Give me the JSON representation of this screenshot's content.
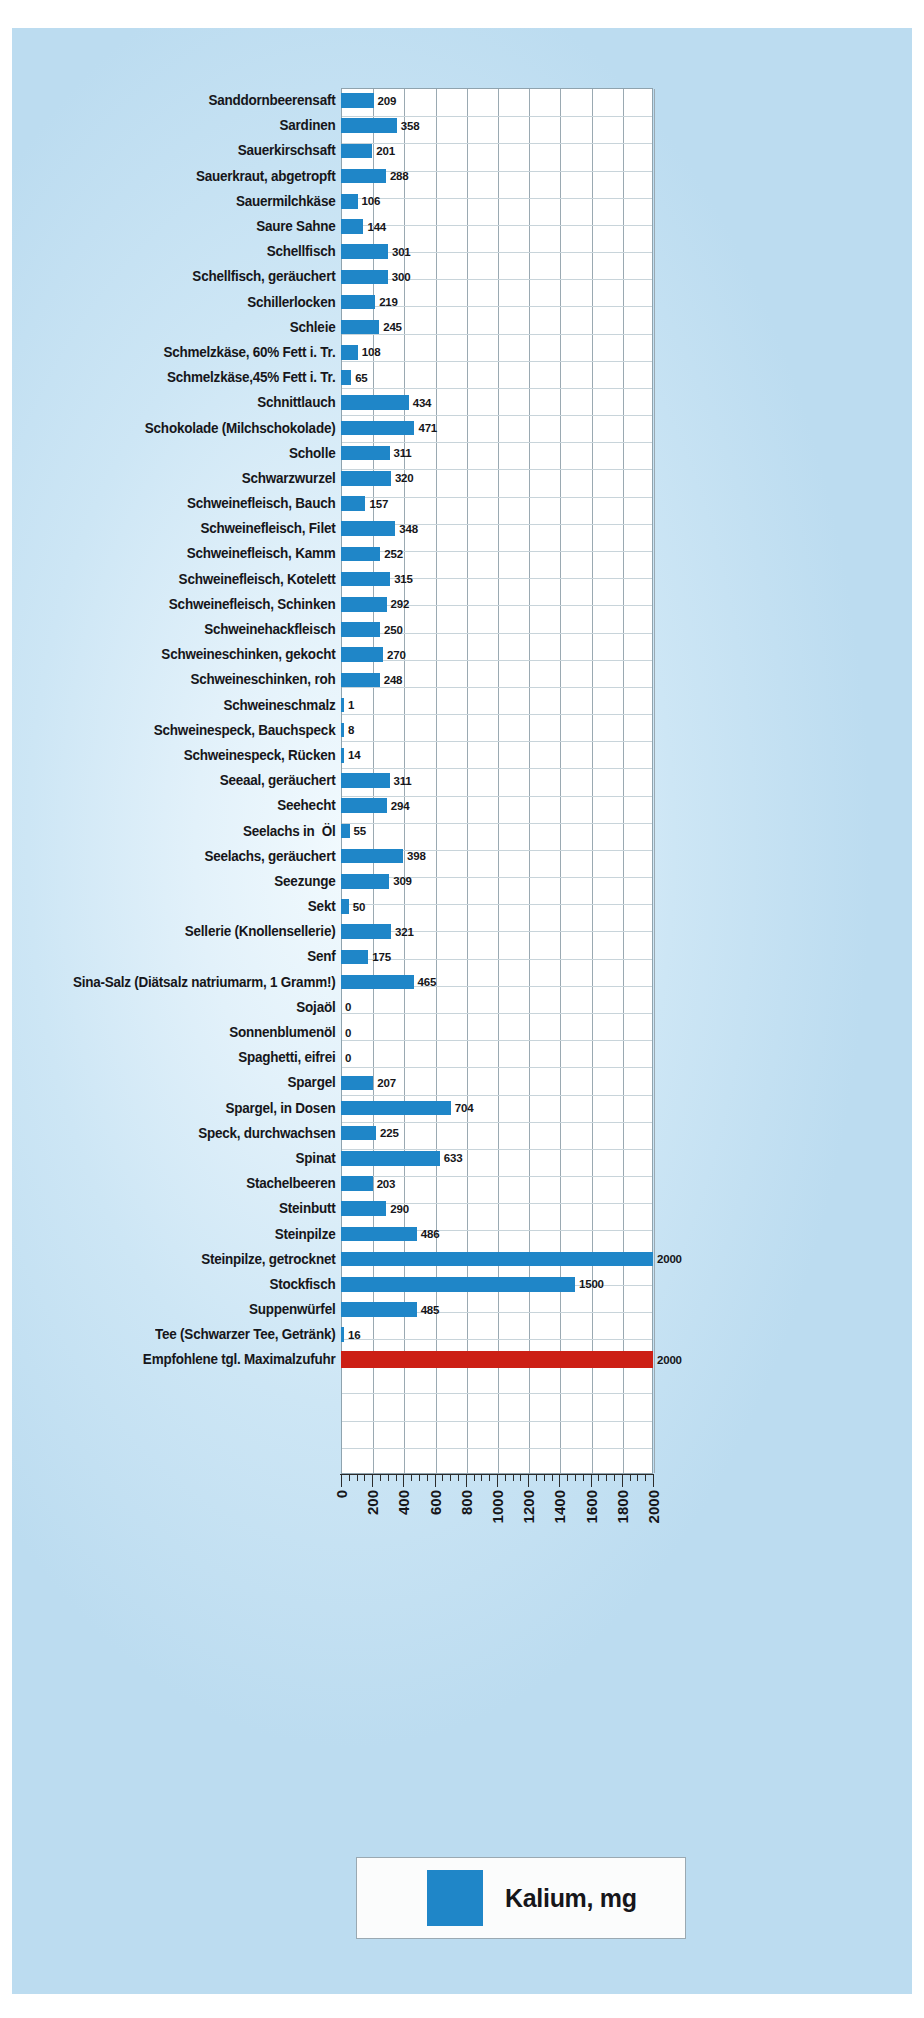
{
  "legend": {
    "series_label": "Kalium, mg",
    "swatch_color": "#1f86c8"
  },
  "axis": {
    "tick_labels": [
      "0",
      "200",
      "400",
      "600",
      "800",
      "1000",
      "1200",
      "1400",
      "1600",
      "1800",
      "2000"
    ]
  },
  "colors": {
    "bar": "#1f86c8",
    "limit_bar": "#cc1f15",
    "background": "#cde6f5",
    "plot_background": "#ffffff"
  },
  "chart_data": {
    "type": "bar",
    "orientation": "horizontal",
    "title": "",
    "xlabel": "",
    "ylabel": "",
    "xlim": [
      0,
      2000
    ],
    "grid": true,
    "legend_position": "bottom",
    "series": [
      {
        "name": "Kalium, mg",
        "color": "#1f86c8"
      }
    ],
    "categories": [
      "Sanddornbeerensaft",
      "Sardinen",
      "Sauerkirschsaft",
      "Sauerkraut, abgetropft",
      "Sauermilchkäse",
      "Saure Sahne",
      "Schellfisch",
      "Schellfisch, geräuchert",
      "Schillerlocken",
      "Schleie",
      "Schmelzkäse, 60% Fett i. Tr.",
      "Schmelzkäse,45% Fett i. Tr.",
      "Schnittlauch",
      "Schokolade (Milchschokolade)",
      "Scholle",
      "Schwarzwurzel",
      "Schweinefleisch, Bauch",
      "Schweinefleisch, Filet",
      "Schweinefleisch, Kamm",
      "Schweinefleisch, Kotelett",
      "Schweinefleisch, Schinken",
      "Schweinehackfleisch",
      "Schweineschinken, gekocht",
      "Schweineschinken, roh",
      "Schweineschmalz",
      "Schweinespeck, Bauchspeck",
      "Schweinespeck, Rücken",
      "Seeaal, geräuchert",
      "Seehecht",
      "Seelachs in  Öl",
      "Seelachs, geräuchert",
      "Seezunge",
      "Sekt",
      "Sellerie (Knollensellerie)",
      "Senf",
      "Sina-Salz (Diätsalz natriumarm, 1 Gramm!)",
      "Sojaöl",
      "Sonnenblumenöl",
      "Spaghetti, eifrei",
      "Spargel",
      "Spargel, in Dosen",
      "Speck, durchwachsen",
      "Spinat",
      "Stachelbeeren",
      "Steinbutt",
      "Steinpilze",
      "Steinpilze, getrocknet",
      "Stockfisch",
      "Suppenwürfel",
      "Tee (Schwarzer Tee, Getränk)",
      "Empfohlene tgl. Maximalzufuhr"
    ],
    "values": [
      209,
      358,
      201,
      288,
      106,
      144,
      301,
      300,
      219,
      245,
      108,
      65,
      434,
      471,
      311,
      320,
      157,
      348,
      252,
      315,
      292,
      250,
      270,
      248,
      1,
      8,
      14,
      311,
      294,
      55,
      398,
      309,
      50,
      321,
      175,
      465,
      0,
      0,
      0,
      207,
      704,
      225,
      633,
      203,
      290,
      486,
      2000,
      1500,
      485,
      16,
      2000
    ],
    "value_labels": [
      "209",
      "358",
      "201",
      "288",
      "106",
      "144",
      "301",
      "300",
      "219",
      "245",
      "108",
      "65",
      "434",
      "471",
      "311",
      "320",
      "157",
      "348",
      "252",
      "315",
      "292",
      "250",
      "270",
      "248",
      "1",
      "8",
      "14",
      "311",
      "294",
      "55",
      "398",
      "309",
      "50",
      "321",
      "175",
      "465",
      "0",
      "0",
      "0",
      "207",
      "704",
      "225",
      "633",
      "203",
      "290",
      "486",
      "2000",
      "1500",
      "485",
      "16",
      "2000"
    ],
    "highlight_index": 50,
    "highlight_color": "#cc1f15",
    "highlight_note": "Empfohlene tgl. Maximalzufuhr is drawn in red"
  }
}
